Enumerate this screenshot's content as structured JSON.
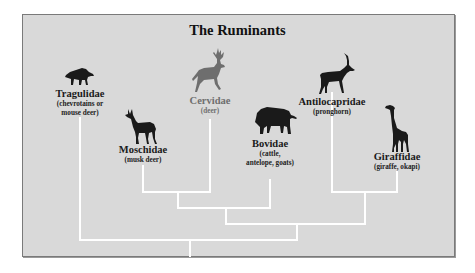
{
  "title": "The Ruminants",
  "colors": {
    "background": "#d9d9d9",
    "frame_border": "#7a7a7a",
    "branch": "#ffffff",
    "silhouette": "#1a1a1a",
    "highlight_silhouette": "#6e6e6e"
  },
  "taxa": [
    {
      "name": "Tragulidae",
      "common_line1": "(chevrotains or",
      "common_line2": "mouse deer)",
      "icon": "chevrotain-icon"
    },
    {
      "name": "Moschidae",
      "common_line1": "(musk deer)",
      "icon": "musk-deer-icon"
    },
    {
      "name": "Cervidae",
      "common_line1": "(deer)",
      "icon": "deer-icon",
      "highlighted": true
    },
    {
      "name": "Bovidae",
      "common_line1": "(cattle,",
      "common_line2": "antelope, goats)",
      "icon": "bison-icon"
    },
    {
      "name": "Antilocapridae",
      "common_line1": "(pronghorn)",
      "icon": "antelope-icon"
    },
    {
      "name": "Giraffidae",
      "common_line1": "(giraffe, okapi)",
      "icon": "giraffe-icon"
    }
  ],
  "tree": {
    "topology": "(Tragulidae, ((Moschidae, Cervidae), Bovidae), (Antilocapridae, Giraffidae))"
  }
}
